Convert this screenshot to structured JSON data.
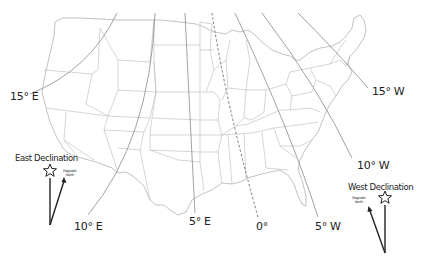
{
  "map": {
    "title": "Magnetic Declination – Continental United States",
    "colors": {
      "state_border": "#b8b8b8",
      "isogonic_line": "#8a8a8a",
      "zero_line": "#7a7a7a",
      "text": "#222222",
      "background": "#ffffff"
    },
    "isogonic_labels": [
      {
        "id": "15E",
        "text": "15° E"
      },
      {
        "id": "10E",
        "text": "10° E"
      },
      {
        "id": "5E",
        "text": "5° E"
      },
      {
        "id": "0",
        "text": "0°"
      },
      {
        "id": "5W",
        "text": "5° W"
      },
      {
        "id": "10W",
        "text": "10° W"
      },
      {
        "id": "15W",
        "text": "15° W"
      }
    ]
  },
  "legend": {
    "east": {
      "title": "East Declination",
      "magnetic_label_line1": "Magnetic",
      "magnetic_label_line2": "North",
      "true_north_icon": "star-icon"
    },
    "west": {
      "title": "West Declination",
      "magnetic_label_line1": "Magnetic",
      "magnetic_label_line2": "North",
      "true_north_icon": "star-icon"
    }
  }
}
